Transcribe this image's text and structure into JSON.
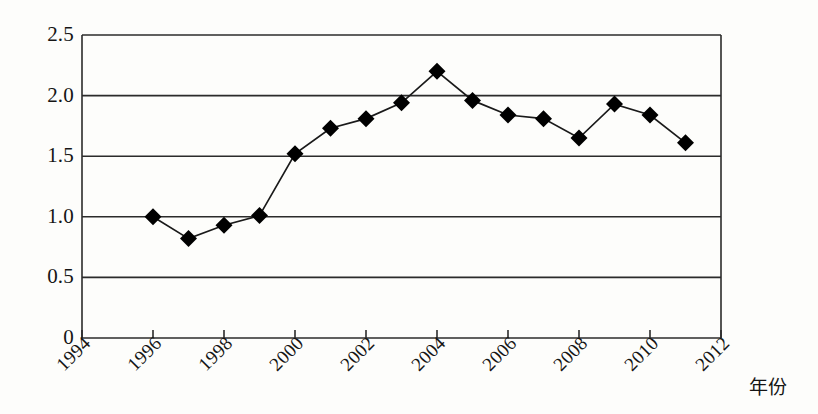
{
  "chart_data": {
    "type": "line",
    "title": "",
    "subtitle": "",
    "xlabel": "年份",
    "ylabel": "",
    "x": [
      1996,
      1997,
      1998,
      1999,
      2000,
      2001,
      2002,
      2003,
      2004,
      2005,
      2006,
      2007,
      2008,
      2009,
      2010,
      2011
    ],
    "values": [
      1.0,
      0.82,
      0.93,
      1.01,
      1.52,
      1.73,
      1.81,
      1.94,
      2.2,
      1.96,
      1.84,
      1.81,
      1.65,
      1.93,
      1.84,
      1.61
    ],
    "series": [
      {
        "name": "",
        "values": [
          1.0,
          0.82,
          0.93,
          1.01,
          1.52,
          1.73,
          1.81,
          1.94,
          2.2,
          1.96,
          1.84,
          1.81,
          1.65,
          1.93,
          1.84,
          1.61
        ]
      }
    ],
    "xlim": [
      1994,
      2012
    ],
    "ylim": [
      0,
      2.5
    ],
    "x_tick_values": [
      1994,
      1996,
      1998,
      2000,
      2002,
      2004,
      2006,
      2008,
      2010,
      2012
    ],
    "x_tick_labels": [
      "1994",
      "1996",
      "1998",
      "2000",
      "2002",
      "2004",
      "2006",
      "2008",
      "2010",
      "2012"
    ],
    "y_tick_values": [
      0,
      0.5,
      1.0,
      1.5,
      2.0,
      2.5
    ],
    "y_tick_labels": [
      "0",
      "0.5",
      "1.0",
      "1.5",
      "2.0",
      "2.5"
    ],
    "grid": "horizontal",
    "legend": "none",
    "marker": "diamond",
    "marker_color": "#000000",
    "line_color": "#1a1a1a",
    "frame_color": "#2b2b2b",
    "background": "#fdfdfb"
  }
}
